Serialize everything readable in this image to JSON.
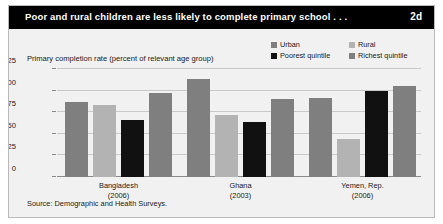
{
  "figure": {
    "title": "Poor and rural children are less likely to complete primary school . . .",
    "number": "2d",
    "source": "Source: Demographic and Health Surveys."
  },
  "colors": {
    "title_bar_background": "#000000",
    "title_bar_text": "#ffffff",
    "panel_background": "#f1f1f1",
    "panel_border": "#b9b9b9",
    "urban": "#7f7f7f",
    "rural": "#b3b3b3",
    "poorest_quintile": "#111111",
    "richest_quintile": "#7f7f7f",
    "gridline": "#c9c9c9",
    "axis": "#8a8a8a",
    "text": "#1a1a1a"
  },
  "legend": {
    "items": [
      {
        "label": "Urban",
        "color": "#7f7f7f"
      },
      {
        "label": "Rural",
        "color": "#b3b3b3"
      },
      {
        "label": "Poorest quintile",
        "color": "#111111"
      },
      {
        "label": "Richest quintile",
        "color": "#7f7f7f"
      }
    ]
  },
  "chart_data": {
    "type": "bar",
    "title": "Poor and rural children are less likely to complete primary school . . .",
    "subtitle": "",
    "ylabel": "Primary completion rate (percent of relevant age group)",
    "xlabel": "",
    "ylim": [
      0,
      125
    ],
    "yticks": [
      0,
      25,
      50,
      75,
      100,
      125
    ],
    "ytick_labels": [
      "0",
      "25",
      "50",
      "75",
      "100",
      "125"
    ],
    "grid": true,
    "legend_position": "top-right",
    "categories": [
      "Bangladesh\n(2006)",
      "Ghana\n(2003)",
      "Yemen, Rep.\n(2006)"
    ],
    "category_lines": [
      {
        "name": "Bangladesh",
        "year": "(2006)"
      },
      {
        "name": "Ghana",
        "year": "(2003)"
      },
      {
        "name": "Yemen, Rep.",
        "year": "(2006)"
      }
    ],
    "series": [
      {
        "name": "Urban",
        "color": "#7f7f7f",
        "values": [
          87,
          114,
          91
        ]
      },
      {
        "name": "Rural",
        "color": "#b3b3b3",
        "values": [
          83,
          72,
          44
        ]
      },
      {
        "name": "Poorest quintile",
        "color": "#111111",
        "values": [
          66,
          64,
          100
        ]
      },
      {
        "name": "Richest quintile",
        "color": "#7f7f7f",
        "values": [
          97,
          90,
          105
        ]
      }
    ],
    "source": "Source: Demographic and Health Surveys."
  }
}
